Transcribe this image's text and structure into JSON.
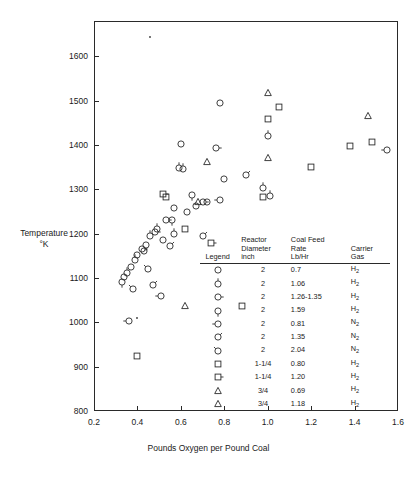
{
  "chart_data": {
    "type": "scatter",
    "title": "",
    "xlabel": "Pounds Oxygen per Pound Coal",
    "ylabel": "Temperature\n°K",
    "ylabel_line1": "Temperature",
    "ylabel_line2": "°K",
    "xlim": [
      0.2,
      1.6
    ],
    "ylim": [
      800,
      1680
    ],
    "xticks": [
      "0.2",
      "0.4",
      "0.6",
      "0.8",
      "1.0",
      "1.2",
      "1.4",
      "1.6"
    ],
    "xtick_values": [
      0.2,
      0.4,
      0.6,
      0.8,
      1.0,
      1.2,
      1.4,
      1.6
    ],
    "yticks": [
      "800",
      "900",
      "1000",
      "1100",
      "1200",
      "1300",
      "1400",
      "1500",
      "1600"
    ],
    "ytick_values": [
      800,
      900,
      1000,
      1100,
      1200,
      1300,
      1400,
      1500,
      1600
    ],
    "grid": false,
    "legend_position": "inside-lower-right",
    "marker_color": "#2a2a2a",
    "series": [
      {
        "name": "2 inch, 0.7 Lb/Hr, H2",
        "marker": "circle",
        "tick": "none",
        "points": [
          {
            "x": 0.34,
            "y": 1103
          },
          {
            "x": 0.37,
            "y": 1126
          },
          {
            "x": 0.4,
            "y": 1152
          },
          {
            "x": 0.43,
            "y": 1160
          },
          {
            "x": 0.52,
            "y": 1185
          },
          {
            "x": 0.57,
            "y": 1258
          },
          {
            "x": 0.6,
            "y": 1402
          },
          {
            "x": 0.63,
            "y": 1250
          },
          {
            "x": 0.67,
            "y": 1262
          },
          {
            "x": 0.72,
            "y": 1272
          },
          {
            "x": 0.78,
            "y": 1494
          },
          {
            "x": 0.8,
            "y": 1324
          }
        ]
      },
      {
        "name": "2 inch, 1.06 Lb/Hr, H2",
        "marker": "circle",
        "tick": "top",
        "points": [
          {
            "x": 0.35,
            "y": 1112
          },
          {
            "x": 0.39,
            "y": 1140
          },
          {
            "x": 0.46,
            "y": 1196
          },
          {
            "x": 0.49,
            "y": 1210
          },
          {
            "x": 0.57,
            "y": 1200
          },
          {
            "x": 0.59,
            "y": 1348
          },
          {
            "x": 0.61,
            "y": 1345
          },
          {
            "x": 0.98,
            "y": 1303
          },
          {
            "x": 1.0,
            "y": 1420
          },
          {
            "x": 1.01,
            "y": 1285
          }
        ]
      },
      {
        "name": "2 inch, 1.26-1.35 Lb/Hr, H2",
        "marker": "circle",
        "tick": "right",
        "points": [
          {
            "x": 0.42,
            "y": 1166
          },
          {
            "x": 0.48,
            "y": 1205
          },
          {
            "x": 0.53,
            "y": 1232
          },
          {
            "x": 0.7,
            "y": 1272
          },
          {
            "x": 0.76,
            "y": 1394
          }
        ]
      },
      {
        "name": "2 inch, 1.59 Lb/Hr, H2",
        "marker": "circle",
        "tick": "bottom",
        "points": [
          {
            "x": 0.33,
            "y": 1090
          },
          {
            "x": 0.44,
            "y": 1174
          },
          {
            "x": 0.56,
            "y": 1230
          },
          {
            "x": 0.65,
            "y": 1287
          }
        ]
      },
      {
        "name": "2 inch, 0.81 Lb/Hr, N2",
        "marker": "circle",
        "tick": "left",
        "points": [
          {
            "x": 0.36,
            "y": 1003
          },
          {
            "x": 0.51,
            "y": 1060
          },
          {
            "x": 0.78,
            "y": 1277
          },
          {
            "x": 1.55,
            "y": 1388
          }
        ]
      },
      {
        "name": "2 inch, 1.35 Lb/Hr, N2",
        "marker": "circle",
        "tick": "upper-right",
        "points": [
          {
            "x": 0.47,
            "y": 1084
          },
          {
            "x": 0.55,
            "y": 1172
          },
          {
            "x": 0.7,
            "y": 1195
          },
          {
            "x": 0.9,
            "y": 1332
          }
        ]
      },
      {
        "name": "2 inch, 2.04 Lb/Hr, N2",
        "marker": "circle",
        "tick": "upper-left",
        "points": [
          {
            "x": 0.38,
            "y": 1075
          },
          {
            "x": 0.45,
            "y": 1120
          }
        ]
      },
      {
        "name": "1-1/4 inch, 0.80 Lb/Hr, H2",
        "marker": "square",
        "tick": "none",
        "points": [
          {
            "x": 0.4,
            "y": 924
          },
          {
            "x": 0.53,
            "y": 1284
          },
          {
            "x": 0.62,
            "y": 1210
          },
          {
            "x": 0.88,
            "y": 1038
          },
          {
            "x": 0.98,
            "y": 1283
          },
          {
            "x": 1.0,
            "y": 1458
          },
          {
            "x": 1.05,
            "y": 1485
          },
          {
            "x": 1.2,
            "y": 1350
          },
          {
            "x": 1.38,
            "y": 1398
          },
          {
            "x": 1.48,
            "y": 1408
          }
        ]
      },
      {
        "name": "1-1/4 inch, 1.20 Lb/Hr, H2",
        "marker": "square",
        "tick": "right",
        "points": [
          {
            "x": 0.52,
            "y": 1290
          },
          {
            "x": 0.74,
            "y": 1180
          }
        ]
      },
      {
        "name": "3/4 inch, 0.69 Lb/Hr, H2",
        "marker": "triangle",
        "tick": "none",
        "points": [
          {
            "x": 0.62,
            "y": 1036
          },
          {
            "x": 0.68,
            "y": 1272
          },
          {
            "x": 0.72,
            "y": 1362
          },
          {
            "x": 1.0,
            "y": 1370
          },
          {
            "x": 1.0,
            "y": 1518
          }
        ]
      },
      {
        "name": "3/4 inch, 1.18 Lb/Hr, H2",
        "marker": "triangle",
        "tick": "none",
        "points": [
          {
            "x": 1.46,
            "y": 1466
          }
        ]
      },
      {
        "name": "stray mark",
        "marker": "dot",
        "tick": "none",
        "points": [
          {
            "x": 0.46,
            "y": 1645
          },
          {
            "x": 0.4,
            "y": 1010
          }
        ]
      }
    ]
  },
  "legend": {
    "headers": {
      "symbol": "Legend",
      "diameter_line1": "Reactor",
      "diameter_line2": "Diameter",
      "diameter_line3": "inch",
      "rate_line1": "Coal Feed",
      "rate_line2": "Rate",
      "rate_line3": "Lb/Hr",
      "gas_line1": "Carrier",
      "gas_line2": "Gas"
    },
    "rows": [
      {
        "marker": "circle",
        "tick": "none",
        "diameter": "2",
        "rate": "0.7",
        "gas": "H",
        "gas_sub": "2"
      },
      {
        "marker": "circle",
        "tick": "top",
        "diameter": "2",
        "rate": "1.06",
        "gas": "H",
        "gas_sub": "2"
      },
      {
        "marker": "circle",
        "tick": "right",
        "diameter": "2",
        "rate": "1.26-1.35",
        "gas": "H",
        "gas_sub": "2"
      },
      {
        "marker": "circle",
        "tick": "bottom",
        "diameter": "2",
        "rate": "1.59",
        "gas": "H",
        "gas_sub": "2"
      },
      {
        "marker": "circle",
        "tick": "left",
        "diameter": "2",
        "rate": "0.81",
        "gas": "N",
        "gas_sub": "2"
      },
      {
        "marker": "circle",
        "tick": "upper-right",
        "diameter": "2",
        "rate": "1.35",
        "gas": "N",
        "gas_sub": "2"
      },
      {
        "marker": "circle",
        "tick": "upper-left",
        "diameter": "2",
        "rate": "2.04",
        "gas": "N",
        "gas_sub": "2"
      },
      {
        "marker": "square",
        "tick": "none",
        "diameter": "1-1/4",
        "rate": "0.80",
        "gas": "H",
        "gas_sub": "2"
      },
      {
        "marker": "square",
        "tick": "right",
        "diameter": "1-1/4",
        "rate": "1.20",
        "gas": "H",
        "gas_sub": "2"
      },
      {
        "marker": "triangle",
        "tick": "none",
        "diameter": "3/4",
        "rate": "0.69",
        "gas": "H",
        "gas_sub": "2"
      },
      {
        "marker": "triangle",
        "tick": "none",
        "diameter": "3/4",
        "rate": "1.18",
        "gas": "H",
        "gas_sub": "2"
      }
    ]
  }
}
